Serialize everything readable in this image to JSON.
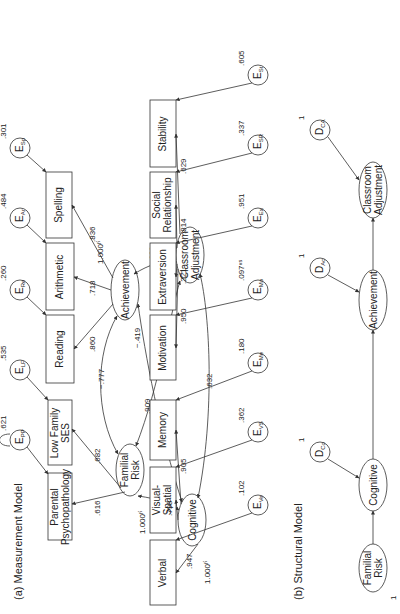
{
  "measurement_model": {
    "title": "(a)  Measurement Model",
    "latents": {
      "familial_risk": {
        "line1": "Familial",
        "line2": "Risk",
        "variance": "1.000ᶠⁱ"
      },
      "achievement": {
        "label": "Achievement",
        "variance": "1.000ᶠⁱ"
      },
      "cognitive": {
        "label": "Cognitive",
        "variance": "1.000ᶠⁱ"
      },
      "classroom_adjustment": {
        "line1": "Classroom",
        "line2": "Adjustment",
        "variance": "1.000ᶠⁱ"
      }
    },
    "indicators_left": [
      {
        "id": "parental_psychopathology",
        "line1": "Parental",
        "line2": "Psychopathology",
        "loading": ".616",
        "error": "E",
        "error_sub": "PP",
        "error_var": ".621"
      },
      {
        "id": "low_family_ses",
        "line1": "Low Family",
        "line2": "SES",
        "loading": ".682",
        "error": "E",
        "error_sub": "LF",
        "error_var": ".535"
      },
      {
        "id": "reading",
        "line1": "Reading",
        "line2": "",
        "loading": ".860",
        "error": "E",
        "error_sub": "Re",
        "error_var": ".260"
      },
      {
        "id": "arithmetic",
        "line1": "Arithmetic",
        "line2": "",
        "loading": ".718",
        "error": "E",
        "error_sub": "Ar",
        "error_var": ".484"
      },
      {
        "id": "spelling",
        "line1": "Spelling",
        "line2": "",
        "loading": ".836",
        "error": "E",
        "error_sub": "Sp",
        "error_var": ".301"
      }
    ],
    "indicators_right": [
      {
        "id": "verbal",
        "line1": "Verbal",
        "line2": "",
        "loading": ".947",
        "error": "E",
        "error_sub": "Ve",
        "error_var": ".102"
      },
      {
        "id": "visual_spatial",
        "line1": "Visual-",
        "line2": "Spatial",
        "loading": ".798",
        "error": "E",
        "error_sub": "VS",
        "error_var": ".362"
      },
      {
        "id": "memory",
        "line1": "Memory",
        "line2": "",
        "loading": ".905",
        "error": "E",
        "error_sub": "Me",
        "error_var": ".180"
      },
      {
        "id": "motivation",
        "line1": "Motivation",
        "line2": "",
        "loading": ".950",
        "error": "E",
        "error_sub": "Mo",
        "error_var": ".097ⁿˢ"
      },
      {
        "id": "extraversion",
        "line1": "Extraversion",
        "line2": "",
        "loading": ".221",
        "error": "E",
        "error_sub": "Ex",
        "error_var": ".951"
      },
      {
        "id": "social_relationship",
        "line1": "Social",
        "line2": "Relationship",
        "loading": ".814",
        "error": "E",
        "error_sub": "SR",
        "error_var": ".337"
      },
      {
        "id": "stability",
        "line1": "Stability",
        "line2": "",
        "loading": ".629",
        "error": "E",
        "error_sub": "St",
        "error_var": ".605"
      }
    ],
    "correlations": {
      "familial_achievement": "−.777",
      "familial_cognitive": "−.622",
      "familial_classroom": ".909",
      "achievement_classroom": ".623",
      "achievement_cognitive": "−.419",
      "cognitive_classroom": ".632"
    }
  },
  "structural_model": {
    "title": "(b)  Structural Model",
    "nodes": {
      "familial_risk": {
        "line1": "Familial",
        "line2": "Risk",
        "variance": "1"
      },
      "cognitive": {
        "label": "Cognitive"
      },
      "achievement": {
        "label": "Achievement"
      },
      "classroom_adjustment": {
        "line1": "Classroom",
        "line2": "Adjustment"
      }
    },
    "disturbances": [
      {
        "id": "d_cognitive",
        "label": "D",
        "sub": "Co",
        "variance": "1"
      },
      {
        "id": "d_achievement",
        "label": "D",
        "sub": "Ac",
        "variance": "1"
      },
      {
        "id": "d_classroom",
        "label": "D",
        "sub": "CA",
        "variance": "1"
      }
    ]
  }
}
